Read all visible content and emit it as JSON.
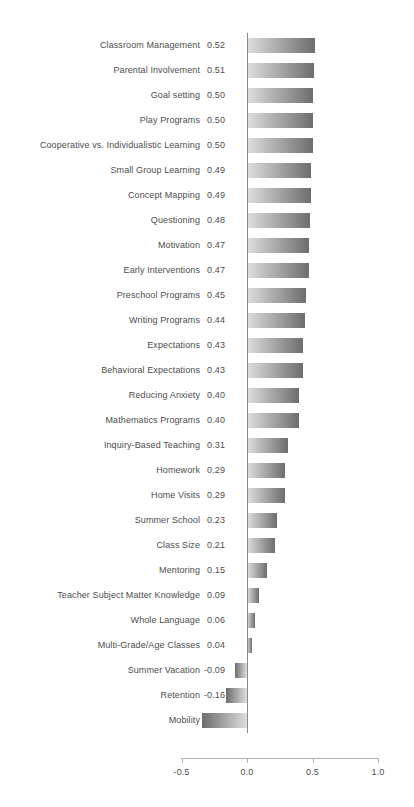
{
  "chart_data": {
    "type": "bar",
    "orientation": "horizontal",
    "title": "",
    "xlabel": "",
    "ylabel": "",
    "xlim": [
      -0.5,
      1.0
    ],
    "xticks": [
      "-0.5",
      "0.0",
      "0.5",
      "1.0"
    ],
    "xtick_values": [
      -0.5,
      0.0,
      0.5,
      1.0
    ],
    "grid": false,
    "legend": "none",
    "categories": [
      "Classroom Management",
      "Parental Involvement",
      "Goal setting",
      "Play Programs",
      "Cooperative vs. Individualistic Learning",
      "Small Group Learning",
      "Concept Mapping",
      "Questioning",
      "Motivation",
      "Early Interventions",
      "Preschool Programs",
      "Writing Programs",
      "Expectations",
      "Behavioral Expectations",
      "Reducing Anxiety",
      "Mathematics Programs",
      "Inquiry-Based Teaching",
      "Homework",
      "Home Visits",
      "Summer School",
      "Class Size",
      "Mentoring",
      "Teacher Subject Matter Knowledge",
      "Whole Language",
      "Multi-Grade/Age Classes",
      "Summer Vacation",
      "Retention",
      "Mobility"
    ],
    "values": [
      0.52,
      0.51,
      0.5,
      0.5,
      0.5,
      0.49,
      0.49,
      0.48,
      0.47,
      0.47,
      0.45,
      0.44,
      0.43,
      0.43,
      0.4,
      0.4,
      0.31,
      0.29,
      0.29,
      0.23,
      0.21,
      0.15,
      0.09,
      0.06,
      0.04,
      -0.09,
      -0.16,
      -0.34
    ],
    "value_labels": [
      "0.52",
      "0.51",
      "0.50",
      "0.50",
      "0.50",
      "0.49",
      "0.49",
      "0.48",
      "0.47",
      "0.47",
      "0.45",
      "0.44",
      "0.43",
      "0.43",
      "0.40",
      "0.40",
      "0.31",
      "0.29",
      "0.29",
      "0.23",
      "0.21",
      "0.15",
      "0.09",
      "0.06",
      "0.04",
      "-0.09",
      "-0.16",
      "-0.34"
    ],
    "colors": {
      "bar_gradient_light": "#dedede",
      "bar_gradient_dark": "#6d6d6d",
      "text": "#4d4d4d",
      "axis": "#b0b0b0",
      "zero_line": "#8a8a8a",
      "background": "#ffffff"
    }
  }
}
